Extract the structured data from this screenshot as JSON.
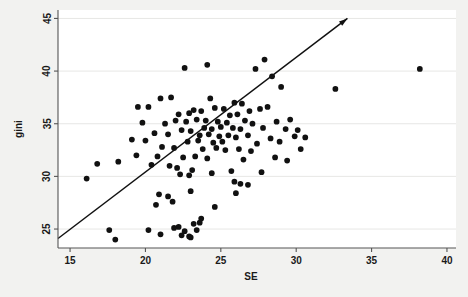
{
  "figure": {
    "background_color": "#f2f2f0",
    "plot_background_color": "#ffffff",
    "marker_color": "#111111",
    "line_color": "#111111",
    "axis_color": "#555555"
  },
  "chart_data": {
    "type": "scatter",
    "title": "",
    "xlabel": "SE",
    "ylabel": "gini",
    "xlim": [
      14.2,
      40.6
    ],
    "ylim": [
      23.2,
      45.8
    ],
    "xticks": [
      15,
      20,
      25,
      30,
      35,
      40
    ],
    "yticks": [
      25,
      30,
      35,
      40,
      45
    ],
    "xtick_labels": [
      "15",
      "20",
      "25",
      "30",
      "35",
      "40"
    ],
    "ytick_labels": [
      "25",
      "30",
      "35",
      "40",
      "45"
    ],
    "grid": "horizontal-light",
    "legend": "none",
    "annotations": [
      {
        "type": "arrow-line",
        "description": "45-degree reference line with arrowhead at upper right",
        "x_start": 14.2,
        "y_start": 24.1,
        "x_end": 33.4,
        "y_end": 45.0
      }
    ],
    "series": [
      {
        "name": "countries",
        "marker": "filled-circle",
        "marker_size": 4.6,
        "points": [
          [
            22.6,
            40.3
          ],
          [
            24.1,
            40.6
          ],
          [
            21.0,
            37.4
          ],
          [
            21.7,
            37.5
          ],
          [
            24.3,
            37.4
          ],
          [
            25.9,
            37.0
          ],
          [
            19.5,
            36.6
          ],
          [
            20.2,
            36.6
          ],
          [
            27.3,
            40.2
          ],
          [
            27.9,
            41.1
          ],
          [
            28.4,
            39.5
          ],
          [
            29.0,
            38.5
          ],
          [
            32.6,
            38.3
          ],
          [
            38.2,
            40.2
          ],
          [
            26.4,
            36.9
          ],
          [
            26.9,
            36.2
          ],
          [
            27.6,
            36.4
          ],
          [
            28.1,
            36.6
          ],
          [
            23.2,
            36.3
          ],
          [
            23.7,
            36.2
          ],
          [
            24.6,
            36.5
          ],
          [
            25.2,
            36.4
          ],
          [
            22.2,
            35.9
          ],
          [
            22.9,
            36.0
          ],
          [
            25.6,
            35.8
          ],
          [
            26.1,
            35.9
          ],
          [
            19.8,
            35.1
          ],
          [
            21.3,
            35.0
          ],
          [
            22.0,
            35.3
          ],
          [
            22.7,
            35.2
          ],
          [
            23.4,
            35.4
          ],
          [
            24.0,
            35.3
          ],
          [
            24.8,
            35.2
          ],
          [
            25.4,
            35.1
          ],
          [
            26.6,
            35.3
          ],
          [
            27.1,
            35.0
          ],
          [
            28.7,
            35.2
          ],
          [
            29.6,
            35.4
          ],
          [
            23.9,
            34.6
          ],
          [
            24.4,
            34.5
          ],
          [
            25.0,
            34.7
          ],
          [
            25.8,
            34.6
          ],
          [
            22.4,
            34.4
          ],
          [
            23.0,
            34.3
          ],
          [
            26.3,
            34.5
          ],
          [
            27.8,
            34.6
          ],
          [
            29.3,
            34.5
          ],
          [
            30.1,
            34.4
          ],
          [
            20.6,
            34.1
          ],
          [
            21.5,
            34.0
          ],
          [
            23.6,
            33.9
          ],
          [
            24.2,
            34.0
          ],
          [
            24.9,
            33.8
          ],
          [
            25.5,
            33.9
          ],
          [
            26.0,
            33.7
          ],
          [
            26.8,
            33.9
          ],
          [
            28.3,
            33.6
          ],
          [
            29.9,
            33.8
          ],
          [
            30.6,
            33.7
          ],
          [
            19.1,
            33.5
          ],
          [
            20.0,
            33.4
          ],
          [
            22.8,
            33.3
          ],
          [
            23.5,
            33.4
          ],
          [
            24.5,
            33.2
          ],
          [
            25.1,
            33.3
          ],
          [
            27.4,
            33.1
          ],
          [
            28.9,
            33.3
          ],
          [
            21.1,
            32.8
          ],
          [
            21.9,
            32.7
          ],
          [
            23.8,
            32.6
          ],
          [
            24.7,
            32.7
          ],
          [
            25.3,
            32.5
          ],
          [
            26.2,
            32.6
          ],
          [
            27.0,
            32.4
          ],
          [
            30.3,
            32.6
          ],
          [
            19.4,
            32.0
          ],
          [
            20.8,
            31.9
          ],
          [
            22.5,
            31.8
          ],
          [
            23.3,
            31.9
          ],
          [
            24.1,
            31.7
          ],
          [
            26.5,
            31.6
          ],
          [
            28.6,
            31.8
          ],
          [
            29.4,
            31.5
          ],
          [
            16.8,
            31.2
          ],
          [
            18.2,
            31.4
          ],
          [
            20.4,
            31.1
          ],
          [
            21.6,
            31.0
          ],
          [
            22.1,
            30.8
          ],
          [
            23.1,
            30.6
          ],
          [
            25.7,
            30.5
          ],
          [
            27.7,
            30.4
          ],
          [
            16.1,
            29.8
          ],
          [
            22.3,
            30.2
          ],
          [
            22.9,
            30.1
          ],
          [
            24.4,
            30.3
          ],
          [
            25.9,
            29.5
          ],
          [
            26.3,
            29.3
          ],
          [
            26.8,
            29.2
          ],
          [
            20.9,
            28.3
          ],
          [
            21.5,
            28.1
          ],
          [
            23.0,
            28.6
          ],
          [
            26.0,
            28.4
          ],
          [
            20.7,
            27.3
          ],
          [
            21.8,
            27.6
          ],
          [
            24.6,
            27.1
          ],
          [
            17.6,
            24.9
          ],
          [
            18.0,
            24.0
          ],
          [
            20.2,
            24.9
          ],
          [
            21.0,
            24.5
          ],
          [
            22.2,
            25.2
          ],
          [
            22.6,
            24.8
          ],
          [
            22.9,
            24.3
          ],
          [
            23.2,
            25.5
          ],
          [
            23.4,
            24.9
          ],
          [
            23.0,
            24.2
          ],
          [
            21.9,
            25.1
          ],
          [
            23.7,
            26.0
          ],
          [
            23.6,
            25.6
          ],
          [
            22.4,
            24.4
          ]
        ]
      }
    ]
  },
  "axes": {
    "y_axis_title": "gini",
    "x_axis_title": "SE"
  }
}
